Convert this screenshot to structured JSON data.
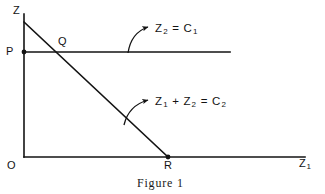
{
  "figure": {
    "caption": "Figure 1",
    "axes": {
      "vertical_label": "Z",
      "horizontal_label": "Z",
      "horizontal_label_sub": "1",
      "origin_label": "O"
    },
    "points": [
      {
        "name": "P",
        "label": "P",
        "x": 24,
        "y": 52,
        "description": "intercept of horizontal constraint line on Z axis"
      },
      {
        "name": "Q",
        "label": "Q",
        "x": 62,
        "y": 52,
        "description": "intersection of the two constraint lines"
      },
      {
        "name": "R",
        "label": "R",
        "x": 168,
        "y": 157,
        "description": "intercept of diagonal constraint line on Z1 axis"
      }
    ],
    "lines": [
      {
        "name": "horizontal-constraint",
        "label_text": "Z",
        "label_sub1": "2",
        "label_eq": " = C",
        "label_sub2": "1",
        "full_label": "Z2 = C1",
        "from": [
          24,
          52
        ],
        "to": [
          230,
          52
        ]
      },
      {
        "name": "diagonal-constraint",
        "label_text": "Z",
        "label_sub1": "1",
        "label_plus": " + Z",
        "label_sub2": "2",
        "label_eq": " = C",
        "label_sub3": "2",
        "full_label": "Z1 + Z2 = C2",
        "from": [
          24,
          22
        ],
        "to": [
          168,
          157
        ]
      }
    ],
    "leaders": [
      {
        "name": "leader-to-horizontal-line",
        "curve_from": [
          128,
          52
        ],
        "arrow_to": [
          150,
          28
        ]
      },
      {
        "name": "leader-to-diagonal-line",
        "curve_from": [
          124,
          124
        ],
        "arrow_to": [
          150,
          101
        ]
      }
    ],
    "colors": {
      "ink": "#131313",
      "background": "#ffffff",
      "caption_ink": "#1a1a1a"
    }
  }
}
